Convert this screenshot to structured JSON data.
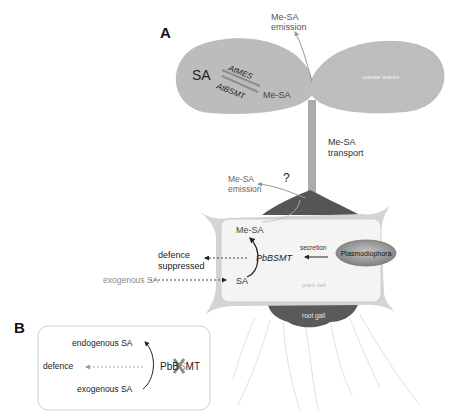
{
  "panels": {
    "a": {
      "label": "A",
      "leaf_left": {
        "sa": "SA",
        "enzyme_top": "AtMES",
        "enzyme_bottom": "AtBSMT",
        "product": "Me-SA"
      },
      "leaf_right_label": "rosette leaves",
      "top_emission": {
        "line1": "Me-SA",
        "line2": "emission"
      },
      "transport": {
        "line1": "Me-SA",
        "line2": "transport"
      },
      "root_emission": {
        "line1": "Me-SA",
        "line2": "emission",
        "question": "?"
      },
      "cell": {
        "me_sa": "Me-SA",
        "enzyme": "PbBSMT",
        "sa": "SA",
        "defence_line1": "defence",
        "defence_line2": "suppressed",
        "exogenous": "exogenous SA",
        "secretion": "secretion",
        "pathogen": "Plasmodiophora",
        "cell_label": "plant cell"
      },
      "gall_label": "root gall"
    },
    "b": {
      "label": "B",
      "endogenous": "endogenous SA",
      "defence": "defence",
      "exogenous": "exogenous SA",
      "enzyme_prefix": "PbB",
      "enzyme_knocked": "S",
      "enzyme_suffix": "MT"
    }
  },
  "colors": {
    "leaf": "#b9b9b9",
    "stem": "#a9a9a9",
    "gall": "#555555",
    "cell_wall": "#c8c8c8",
    "cell_inner": "#f3f3f3",
    "pathogen": "#8f8f8f",
    "text_dark": "#222222",
    "text_mid": "#555555",
    "text_light": "#9a9a9a"
  }
}
